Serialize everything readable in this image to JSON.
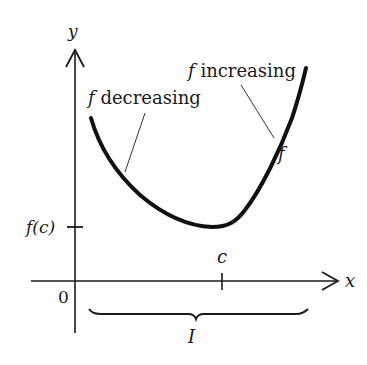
{
  "diagram": {
    "type": "function-monotonicity-graph",
    "axes": {
      "x_label": "x",
      "y_label": "y",
      "origin_label": "0"
    },
    "ticks": {
      "y_tick_label": "f(c)",
      "x_tick_label": "c"
    },
    "annotations": {
      "decreasing": {
        "f": "f",
        "text": " decreasing"
      },
      "increasing": {
        "f": "f",
        "text": " increasing"
      },
      "curve_name": "f"
    },
    "interval_label": "I",
    "colors": {
      "ink": "#1a1a1a",
      "background": "#ffffff"
    }
  }
}
